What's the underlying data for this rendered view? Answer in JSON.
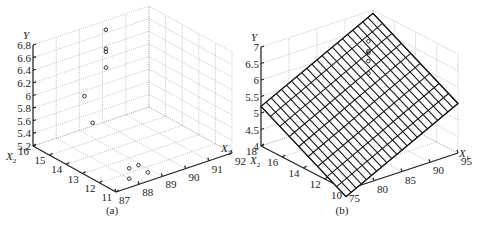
{
  "chart_data": [
    {
      "type": "scatter",
      "subtype": "3d-scatter",
      "caption": "(a)",
      "xlabel": "X1",
      "ylabel": "X2",
      "zlabel": "Y",
      "x_ticks": [
        "87",
        "88",
        "89",
        "90",
        "91",
        "92"
      ],
      "y_ticks": [
        "11",
        "12",
        "13",
        "14",
        "15",
        "16"
      ],
      "z_ticks": [
        "5.2",
        "5.4",
        "5.6",
        "5.8",
        "6",
        "6.2",
        "6.4",
        "6.6",
        "6.8"
      ],
      "xlim": [
        87,
        92
      ],
      "ylim": [
        11,
        16
      ],
      "zlim": [
        5.2,
        6.8
      ],
      "grid": true,
      "points": [
        {
          "x1": 90.0,
          "x2": 15.8,
          "y": 6.7
        },
        {
          "x1": 90.0,
          "x2": 15.8,
          "y": 6.4
        },
        {
          "x1": 90.0,
          "x2": 15.8,
          "y": 6.35
        },
        {
          "x1": 90.0,
          "x2": 15.8,
          "y": 6.1
        },
        {
          "x1": 88.5,
          "x2": 15.0,
          "y": 5.95
        },
        {
          "x1": 88.5,
          "x2": 14.5,
          "y": 5.6
        },
        {
          "x1": 88.5,
          "x2": 12.3,
          "y": 5.2
        },
        {
          "x1": 88.9,
          "x2": 12.3,
          "y": 5.2
        },
        {
          "x1": 88.0,
          "x2": 11.6,
          "y": 5.2
        },
        {
          "x1": 88.8,
          "x2": 11.6,
          "y": 5.2
        }
      ]
    },
    {
      "type": "surface",
      "subtype": "3d-mesh-plane-with-points",
      "caption": "(b)",
      "xlabel": "X1",
      "ylabel": "X2",
      "zlabel": "Y",
      "x_ticks": [
        "75",
        "80",
        "85",
        "90",
        "95"
      ],
      "y_ticks": [
        "10",
        "12",
        "14",
        "16",
        "18"
      ],
      "z_ticks": [
        "4",
        "4.5",
        "5",
        "5.5",
        "6",
        "6.5",
        "7"
      ],
      "xlim": [
        75,
        95
      ],
      "ylim": [
        10,
        18
      ],
      "zlim": [
        4,
        7
      ],
      "grid": true,
      "mesh_lines": {
        "x_dir": 22,
        "y_dir": 9
      },
      "plane_corners": [
        {
          "x1": 75,
          "x2": 18,
          "y": 5.2
        },
        {
          "x1": 95,
          "x2": 18,
          "y": 6.9
        },
        {
          "x1": 95,
          "x2": 10,
          "y": 5.5
        },
        {
          "x1": 75,
          "x2": 10,
          "y": 3.8
        }
      ]
    }
  ],
  "figure": {
    "panels": [
      {
        "caption": "(a)",
        "y_label": "Y",
        "x1_label": "X",
        "x1_sub": "1",
        "x2_label": "X",
        "x2_sub": "2"
      },
      {
        "caption": "(b)",
        "y_label": "Y",
        "x1_label": "X",
        "x1_sub": "1",
        "x2_label": "X",
        "x2_sub": "2"
      }
    ]
  }
}
